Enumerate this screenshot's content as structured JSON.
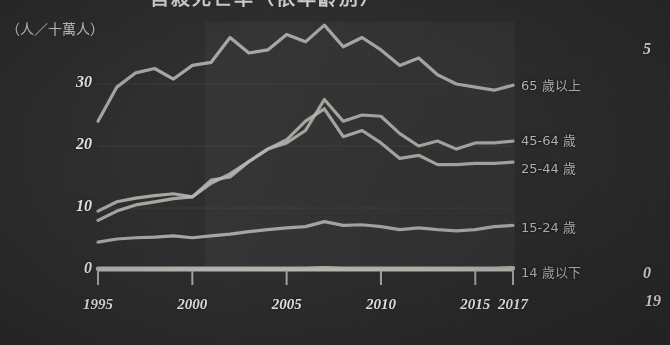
{
  "figure": {
    "title_partial": "自殺死亡率（依年齡別）",
    "y_axis_unit_label": "（人／十萬人）",
    "background_color": "#2e2e2e",
    "line_color": "#b9b7b2",
    "text_color": "#eceae5"
  },
  "axes": {
    "y_ticks": [
      "30",
      "20",
      "10",
      "0"
    ],
    "x_ticks": [
      "1995",
      "2000",
      "2005",
      "2010",
      "2015",
      "2017"
    ]
  },
  "legend": {
    "items": [
      {
        "label": "65 歲以上"
      },
      {
        "label": "45-64 歲"
      },
      {
        "label": "25-44 歲"
      },
      {
        "label": "15-24 歲"
      },
      {
        "label": "14 歲以下"
      }
    ]
  },
  "neighbor_chart_edge": {
    "y_top": "5",
    "y_bottom": "0",
    "x_start": "19"
  },
  "chart_data": {
    "type": "line",
    "title": "自殺死亡率（依年齡別）",
    "xlabel": "",
    "ylabel": "（人／十萬人）",
    "xlim": [
      1995,
      2017
    ],
    "ylim": [
      0,
      40
    ],
    "yticks": [
      0,
      10,
      20,
      30
    ],
    "xticks": [
      1995,
      2000,
      2005,
      2010,
      2015,
      2017
    ],
    "grid": true,
    "legend_position": "right-inline",
    "x": [
      1995,
      1996,
      1997,
      1998,
      1999,
      2000,
      2001,
      2002,
      2003,
      2004,
      2005,
      2006,
      2007,
      2008,
      2009,
      2010,
      2011,
      2012,
      2013,
      2014,
      2015,
      2016,
      2017
    ],
    "series": [
      {
        "name": "65 歲以上",
        "values": [
          24.0,
          29.5,
          31.8,
          32.5,
          30.8,
          33.0,
          33.5,
          37.5,
          35.0,
          35.5,
          38.0,
          36.8,
          39.5,
          36.0,
          37.5,
          35.5,
          33.0,
          34.2,
          31.5,
          30.0,
          29.5,
          29.0,
          29.8
        ]
      },
      {
        "name": "45-64 歲",
        "values": [
          9.5,
          11.0,
          11.6,
          12.0,
          12.3,
          11.8,
          14.0,
          15.5,
          17.5,
          19.5,
          20.5,
          22.5,
          27.5,
          24.0,
          25.0,
          24.8,
          22.0,
          20.0,
          20.8,
          19.5,
          20.5,
          20.5,
          20.8
        ]
      },
      {
        "name": "25-44 歲",
        "values": [
          8.0,
          9.5,
          10.5,
          11.0,
          11.5,
          11.8,
          14.5,
          15.0,
          17.5,
          19.5,
          21.0,
          24.0,
          26.0,
          21.5,
          22.5,
          20.5,
          18.0,
          18.5,
          17.0,
          17.0,
          17.2,
          17.2,
          17.4
        ]
      },
      {
        "name": "15-24 歲",
        "values": [
          4.5,
          5.0,
          5.2,
          5.3,
          5.5,
          5.2,
          5.5,
          5.8,
          6.2,
          6.5,
          6.8,
          7.0,
          7.8,
          7.2,
          7.3,
          7.0,
          6.5,
          6.8,
          6.5,
          6.3,
          6.5,
          7.0,
          7.2
        ]
      },
      {
        "name": "14 歲以下",
        "values": [
          0.2,
          0.2,
          0.2,
          0.2,
          0.2,
          0.2,
          0.2,
          0.2,
          0.2,
          0.2,
          0.2,
          0.2,
          0.3,
          0.2,
          0.2,
          0.2,
          0.2,
          0.2,
          0.2,
          0.2,
          0.2,
          0.2,
          0.3
        ]
      }
    ]
  }
}
